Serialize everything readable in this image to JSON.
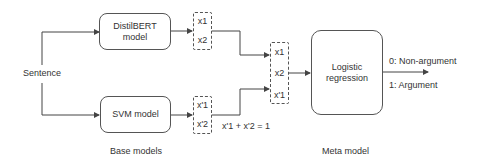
{
  "input": {
    "label": "Sentence"
  },
  "base_models": {
    "section_label": "Base models",
    "distilbert": {
      "line1": "DistilBERT",
      "line2": "model",
      "outputs": [
        "x1",
        "x2"
      ]
    },
    "svm": {
      "label": "SVM model",
      "outputs": [
        "x'1",
        "x'2"
      ],
      "constraint": "x'1 + x'2 = 1"
    }
  },
  "meta_features": [
    "x1",
    "x2",
    "x'1"
  ],
  "meta_model": {
    "section_label": "Meta model",
    "line1": "Logistic",
    "line2": "regression",
    "outputs": [
      "0: Non-argument",
      "1: Argument"
    ]
  },
  "colors": {
    "line": "#444444",
    "text": "#333333",
    "background": "#ffffff"
  }
}
